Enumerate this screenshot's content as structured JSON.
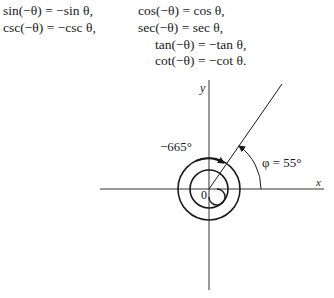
{
  "identities": {
    "left": [
      {
        "lhs": "sin(−θ)",
        "rhs": "−sin θ,"
      },
      {
        "lhs": "csc(−θ)",
        "rhs": "−csc θ,"
      }
    ],
    "right": [
      {
        "lhs": "cos(−θ)",
        "rhs": "cos θ,"
      },
      {
        "lhs": "sec(−θ)",
        "rhs": "sec θ,"
      },
      {
        "lhs": "tan(−θ)",
        "rhs": "−tan θ,"
      },
      {
        "lhs": "cot(−θ)",
        "rhs": "−cot θ."
      }
    ],
    "equals": "="
  },
  "figure": {
    "y_axis_label": "y",
    "x_axis_label": "x",
    "origin_label": "0",
    "angle_label": "−665°",
    "reference_angle_label": "φ = 55°"
  }
}
